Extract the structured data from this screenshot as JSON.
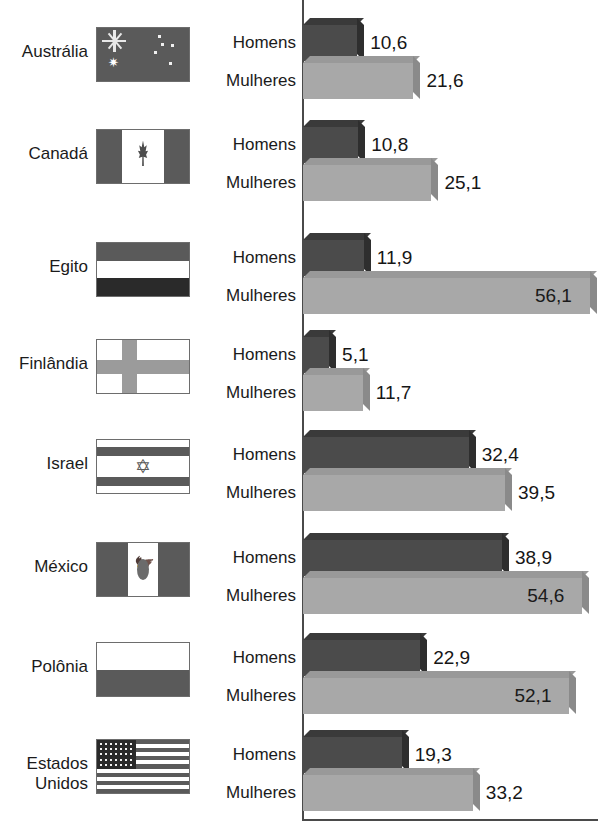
{
  "chart_data": {
    "type": "bar",
    "orientation": "horizontal",
    "title": "",
    "xlabel": "",
    "ylabel": "",
    "xlim": [
      0,
      58
    ],
    "grid": false,
    "legend_position": "inline-row-labels",
    "categories": [
      "Austrália",
      "Canadá",
      "Egito",
      "Finlândia",
      "Israel",
      "México",
      "Polônia",
      "Estados Unidos"
    ],
    "series": [
      {
        "name": "Homens",
        "values": [
          10.6,
          10.8,
          11.9,
          5.1,
          32.4,
          38.9,
          22.9,
          19.3
        ]
      },
      {
        "name": "Mulheres",
        "values": [
          21.6,
          25.1,
          56.1,
          11.7,
          39.5,
          54.6,
          52.1,
          33.2
        ]
      }
    ],
    "value_labels": {
      "Homens": [
        "10,6",
        "10,8",
        "11,9",
        "5,1",
        "32,4",
        "38,9",
        "22,9",
        "19,3"
      ],
      "Mulheres": [
        "21,6",
        "25,1",
        "56,1",
        "11,7",
        "39,5",
        "54,6",
        "52,1",
        "33,2"
      ]
    }
  },
  "series_labels": {
    "men": "Homens",
    "women": "Mulheres"
  },
  "colors": {
    "men_front": "#4b4b4b",
    "men_top": "#3a3a3a",
    "men_side": "#2e2e2e",
    "women_front": "#a8a8a8",
    "women_top": "#999999",
    "women_side": "#8a8a8a",
    "axis": "#4a4a4a",
    "text": "#1b1b1b",
    "background": "#ffffff"
  },
  "groups": [
    {
      "country": "Austrália",
      "flag_name": "flag-australia",
      "men_label": "Homens",
      "men_value": "10,6",
      "women_label": "Mulheres",
      "women_value": "21,6"
    },
    {
      "country": "Canadá",
      "flag_name": "flag-canada",
      "men_label": "Homens",
      "men_value": "10,8",
      "women_label": "Mulheres",
      "women_value": "25,1"
    },
    {
      "country": "Egito",
      "flag_name": "flag-egypt",
      "men_label": "Homens",
      "men_value": "11,9",
      "women_label": "Mulheres",
      "women_value": "56,1"
    },
    {
      "country": "Finlândia",
      "flag_name": "flag-finland",
      "men_label": "Homens",
      "men_value": "5,1",
      "women_label": "Mulheres",
      "women_value": "11,7"
    },
    {
      "country": "Israel",
      "flag_name": "flag-israel",
      "men_label": "Homens",
      "men_value": "32,4",
      "women_label": "Mulheres",
      "women_value": "39,5"
    },
    {
      "country": "México",
      "flag_name": "flag-mexico",
      "men_label": "Homens",
      "men_value": "38,9",
      "women_label": "Mulheres",
      "women_value": "54,6"
    },
    {
      "country": "Polônia",
      "flag_name": "flag-poland",
      "men_label": "Homens",
      "men_value": "22,9",
      "women_label": "Mulheres",
      "women_value": "52,1"
    },
    {
      "country": "Estados\nUnidos",
      "flag_name": "flag-united-states",
      "men_label": "Homens",
      "men_value": "19,3",
      "women_label": "Mulheres",
      "women_value": "33,2"
    }
  ]
}
